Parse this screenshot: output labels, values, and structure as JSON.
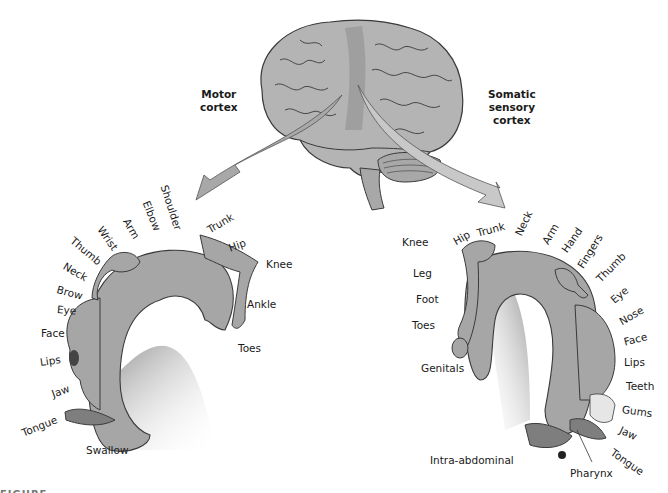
{
  "figure": {
    "caption_fragment": "FIGURE"
  },
  "motor": {
    "title_line1": "Motor",
    "title_line2": "cortex",
    "labels": {
      "shoulder": "Shoulder",
      "elbow": "Elbow",
      "arm": "Arm",
      "wrist": "Wrist",
      "thumb": "Thumb",
      "neck": "Neck",
      "brow": "Brow",
      "eye": "Eye",
      "face": "Face",
      "lips": "Lips",
      "jaw": "Jaw",
      "tongue": "Tongue",
      "swallow": "Swallow",
      "trunk": "Trunk",
      "hip": "Hip",
      "knee": "Knee",
      "ankle": "Ankle",
      "toes": "Toes"
    }
  },
  "sensory": {
    "title_line1": "Somatic",
    "title_line2": "sensory",
    "title_line3": "cortex",
    "labels": {
      "knee": "Knee",
      "hip": "Hip",
      "trunk": "Trunk",
      "neck": "Neck",
      "arm": "Arm",
      "hand": "Hand",
      "fingers": "Fingers",
      "thumb": "Thumb",
      "eye": "Eye",
      "nose": "Nose",
      "face": "Face",
      "lips": "Lips",
      "teeth": "Teeth",
      "gums": "Gums",
      "jaw": "Jaw",
      "tongue": "Tongue",
      "pharynx": "Pharynx",
      "intra_abdominal": "Intra-abdominal",
      "genitals": "Genitals",
      "toes": "Toes",
      "foot": "Foot",
      "leg": "Leg"
    }
  },
  "colors": {
    "brain_fill": "#b4b4b4",
    "brain_stroke": "#3a3a3a",
    "cortex_strip": "#9a9a9a",
    "arrow_motor": "#a8a8a8",
    "arrow_sensory": "#c8c8c8",
    "homunculus_fill": "#a6a6a6"
  }
}
